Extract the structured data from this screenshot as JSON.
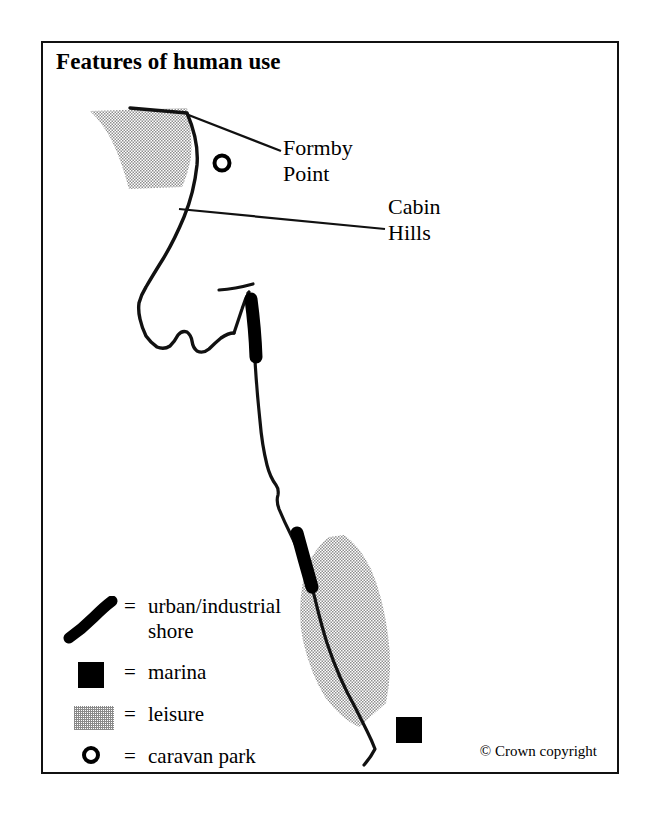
{
  "figure": {
    "title": "Features of human use",
    "copyright": "© Crown copyright",
    "frame_color": "#111111",
    "background_color": "#ffffff"
  },
  "map": {
    "labels": [
      {
        "id": "formby-point",
        "line1": "Formby",
        "line2": "Point"
      },
      {
        "id": "cabin-hills",
        "line1": "Cabin",
        "line2": "Hills"
      }
    ],
    "symbols": {
      "caravan_park_count": 1,
      "marina_count": 1,
      "urban_shore_segments": 2,
      "leisure_zones": 2
    },
    "colors": {
      "coastline": "#000000",
      "urban_shore": "#000000",
      "marina": "#000000",
      "leisure_stipple": "#8a8a8a",
      "caravan_ring": "#000000"
    }
  },
  "legend": {
    "equals": "=",
    "items": [
      {
        "id": "urban-industrial-shore",
        "symbol": "thick-diagonal-line",
        "label_line1": "urban/industrial",
        "label_line2": "shore"
      },
      {
        "id": "marina",
        "symbol": "filled-square",
        "label_line1": "marina",
        "label_line2": ""
      },
      {
        "id": "leisure",
        "symbol": "stippled-rectangle",
        "label_line1": "leisure",
        "label_line2": ""
      },
      {
        "id": "caravan-park",
        "symbol": "open-circle",
        "label_line1": "caravan park",
        "label_line2": ""
      }
    ]
  }
}
